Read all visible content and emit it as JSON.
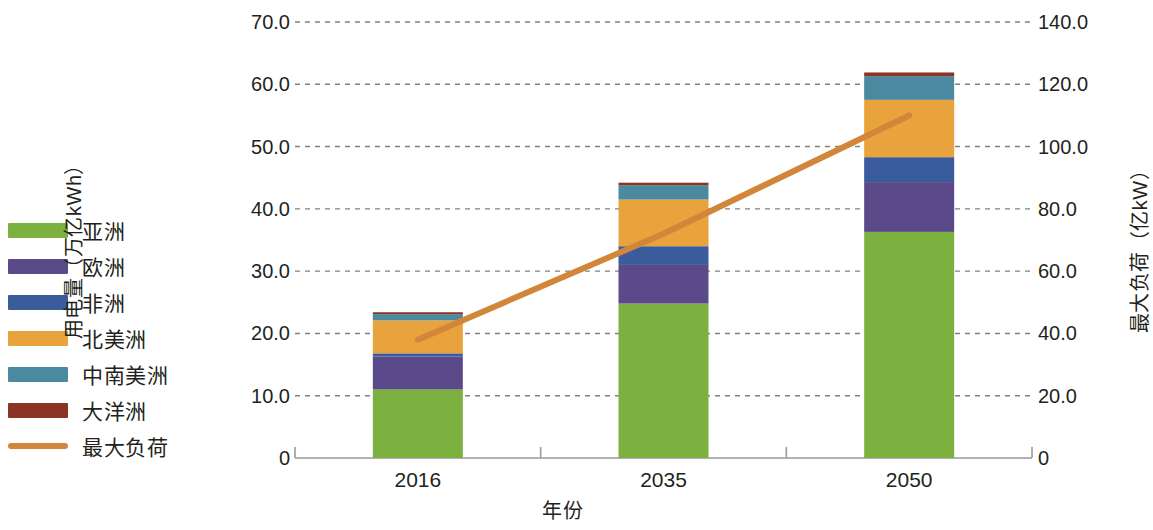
{
  "chart_data": {
    "type": "bar",
    "subtype": "stacked-bar-with-line",
    "title": "",
    "subtitle": "",
    "xlabel": "年份",
    "ylabel": "用电量（万亿kWh）",
    "y2label": "最大负荷（亿kW）",
    "categories": [
      "2016",
      "2035",
      "2050"
    ],
    "ylim": [
      0,
      70
    ],
    "y2lim": [
      0,
      140
    ],
    "y_ticks": [
      "0",
      "10.0",
      "20.0",
      "30.0",
      "40.0",
      "50.0",
      "60.0",
      "70.0"
    ],
    "y_tick_values": [
      0,
      10,
      20,
      30,
      40,
      50,
      60,
      70
    ],
    "y2_ticks": [
      "0",
      "20.0",
      "40.0",
      "60.0",
      "80.0",
      "100.0",
      "120.0",
      "140.0"
    ],
    "y2_tick_values": [
      0,
      20,
      40,
      60,
      80,
      100,
      120,
      140
    ],
    "grid": true,
    "grid_style": "dashed",
    "legend_position": "left",
    "series": [
      {
        "name": "亚洲",
        "type": "bar",
        "axis": "left",
        "color": "#7cb03f",
        "values": [
          11.0,
          24.8,
          36.3
        ]
      },
      {
        "name": "欧洲",
        "type": "bar",
        "axis": "left",
        "color": "#5b4a8a",
        "values": [
          5.3,
          6.2,
          8.0
        ]
      },
      {
        "name": "非洲",
        "type": "bar",
        "axis": "left",
        "color": "#3a5b9c",
        "values": [
          0.5,
          3.0,
          4.0
        ]
      },
      {
        "name": "北美洲",
        "type": "bar",
        "axis": "left",
        "color": "#e8a33d",
        "values": [
          5.3,
          7.5,
          9.2
        ]
      },
      {
        "name": "中南美洲",
        "type": "bar",
        "axis": "left",
        "color": "#4a89a0",
        "values": [
          1.0,
          2.3,
          3.8
        ]
      },
      {
        "name": "大洋洲",
        "type": "bar",
        "axis": "left",
        "color": "#8b3324",
        "values": [
          0.3,
          0.4,
          0.6
        ]
      },
      {
        "name": "最大负荷",
        "type": "line",
        "axis": "right",
        "color": "#d2863a",
        "values": [
          38,
          72,
          110
        ]
      }
    ],
    "totals": [
      23.4,
      44.2,
      61.9
    ]
  },
  "legend": {
    "items": [
      {
        "label": "亚洲",
        "color": "#7cb03f",
        "kind": "swatch"
      },
      {
        "label": "欧洲",
        "color": "#5b4a8a",
        "kind": "swatch"
      },
      {
        "label": "非洲",
        "color": "#3a5b9c",
        "kind": "swatch"
      },
      {
        "label": "北美洲",
        "color": "#e8a33d",
        "kind": "swatch"
      },
      {
        "label": "中南美洲",
        "color": "#4a89a0",
        "kind": "swatch"
      },
      {
        "label": "大洋洲",
        "color": "#8b3324",
        "kind": "swatch"
      },
      {
        "label": "最大负荷",
        "color": "#d2863a",
        "kind": "line"
      }
    ]
  },
  "axes": {
    "left_title": "用电量（万亿kWh）",
    "right_title": "最大负荷（亿kW）",
    "x_title": "年份"
  },
  "colors": {
    "asia": "#7cb03f",
    "europe": "#5b4a8a",
    "africa": "#3a5b9c",
    "north_america": "#e8a33d",
    "central_south_america": "#4a89a0",
    "oceania": "#8b3324",
    "peak_load_line": "#d2863a",
    "grid": "#808080",
    "axis": "#808080",
    "text": "#231f20"
  }
}
